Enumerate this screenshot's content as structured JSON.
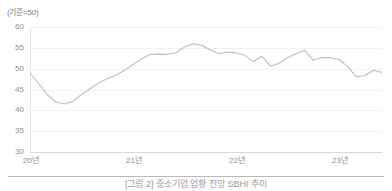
{
  "figure": {
    "unit_label": "(기준=50)",
    "caption": "[그림 2] 중소기업 업황 전망 SBHI 추이"
  },
  "chart_data": {
    "type": "line",
    "title": "",
    "subtitle": "",
    "xlabel": "",
    "ylabel": "(기준=50)",
    "ylim": [
      30,
      60
    ],
    "ytick_values": [
      60,
      55,
      50,
      45,
      40,
      35,
      30
    ],
    "ytick_labels": [
      "60",
      "55",
      "50",
      "45",
      "40",
      "35",
      "30"
    ],
    "xtick_labels": [
      "20년",
      "21년",
      "22년",
      "23년"
    ],
    "xtick_positions": [
      0,
      12,
      24,
      36
    ],
    "grid": true,
    "grid_axis": "y",
    "legend": false,
    "legend_position": "none",
    "reference_line": 50,
    "line_color": "#bdbdbd",
    "line_width": 1.1,
    "x_start": 0,
    "x_end": 41,
    "x": [
      0,
      1,
      2,
      3,
      4,
      5,
      6,
      7,
      8,
      9,
      10,
      11,
      12,
      13,
      14,
      15,
      16,
      17,
      18,
      19,
      20,
      21,
      22,
      23,
      24,
      25,
      26,
      27,
      28,
      29,
      30,
      31,
      32,
      33,
      34,
      35,
      36,
      37,
      38,
      39,
      40,
      41
    ],
    "series": [
      {
        "name": "업황전망 SBHI",
        "values": [
          49.0,
          46.5,
          43.8,
          42.0,
          41.5,
          42.2,
          43.8,
          45.2,
          46.6,
          47.6,
          48.4,
          49.6,
          51.0,
          52.4,
          53.4,
          53.5,
          53.4,
          53.8,
          55.2,
          56.0,
          55.6,
          54.5,
          53.6,
          54.0,
          53.8,
          53.2,
          51.7,
          53.0,
          50.6,
          51.3,
          52.6,
          53.6,
          54.4,
          52.0,
          52.7,
          52.6,
          52.2,
          50.5,
          48.1,
          48.3,
          49.6,
          49.1
        ]
      }
    ]
  }
}
